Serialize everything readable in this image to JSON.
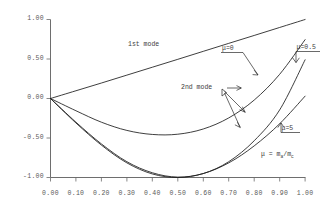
{
  "chart_data": {
    "type": "line",
    "title": "",
    "xlabel": "",
    "ylabel": "",
    "xlim": [
      0.0,
      1.0
    ],
    "ylim": [
      -1.0,
      1.0
    ],
    "grid": false,
    "legend_position": "inline-annotations",
    "xticks": [
      "0.00",
      "0.10",
      "0.20",
      "0.30",
      "0.40",
      "0.50",
      "0.60",
      "0.70",
      "0.80",
      "0.90",
      "1.00"
    ],
    "xtick_values": [
      0.0,
      0.1,
      0.2,
      0.3,
      0.4,
      0.5,
      0.6,
      0.7,
      0.8,
      0.9,
      1.0
    ],
    "yticks": [
      "1.00",
      "0.50",
      "0.00",
      "-0.50",
      "-1.00"
    ],
    "ytick_values": [
      1.0,
      0.5,
      0.0,
      -0.5,
      -1.0
    ],
    "series": [
      {
        "name": "1st mode",
        "x": [
          0.0,
          0.1,
          0.2,
          0.3,
          0.4,
          0.5,
          0.6,
          0.7,
          0.8,
          0.9,
          1.0
        ],
        "values": [
          0.0,
          0.098,
          0.196,
          0.296,
          0.396,
          0.496,
          0.597,
          0.698,
          0.798,
          0.899,
          1.0
        ]
      },
      {
        "name": "2nd mode mu=0",
        "x": [
          0.0,
          0.1,
          0.2,
          0.3,
          0.4,
          0.5,
          0.6,
          0.7,
          0.8,
          0.9,
          1.0
        ],
        "values": [
          0.0,
          -0.155,
          -0.3,
          -0.404,
          -0.455,
          -0.452,
          -0.386,
          -0.246,
          -0.02,
          0.306,
          0.745
        ]
      },
      {
        "name": "2nd mode mu=0.5",
        "x": [
          0.0,
          0.1,
          0.2,
          0.3,
          0.4,
          0.5,
          0.6,
          0.7,
          0.8,
          0.9,
          1.0
        ],
        "values": [
          0.0,
          -0.3,
          -0.575,
          -0.8,
          -0.94,
          -0.995,
          -0.95,
          -0.8,
          -0.535,
          -0.145,
          0.49
        ]
      },
      {
        "name": "2nd mode mu=5",
        "x": [
          0.0,
          0.1,
          0.2,
          0.3,
          0.4,
          0.5,
          0.6,
          0.7,
          0.8,
          0.9,
          1.0
        ],
        "values": [
          0.0,
          -0.31,
          -0.59,
          -0.815,
          -0.955,
          -1.0,
          -0.95,
          -0.815,
          -0.6,
          -0.32,
          0.03
        ]
      }
    ],
    "annotations": [
      {
        "key": "first_mode",
        "text": "1st mode"
      },
      {
        "key": "second_mode",
        "text": "2nd mode"
      },
      {
        "key": "mu0",
        "text": "μ=0"
      },
      {
        "key": "mu05",
        "text": "μ=0.5"
      },
      {
        "key": "mu5",
        "text": "μ=5"
      }
    ]
  },
  "labels": {
    "first_mode": "1st mode",
    "second_mode": "2nd mode",
    "mu_zero": "μ=0",
    "mu_half": "μ=0.5",
    "mu_five": "μ=5",
    "mu_definition_lead": "μ = m",
    "mu_definition_sub1": "a",
    "mu_definition_mid": "/m",
    "mu_definition_sub2": "c"
  },
  "axes": {
    "x_tick_0": "0.00",
    "x_tick_1": "0.10",
    "x_tick_2": "0.20",
    "x_tick_3": "0.30",
    "x_tick_4": "0.40",
    "x_tick_5": "0.50",
    "x_tick_6": "0.60",
    "x_tick_7": "0.70",
    "x_tick_8": "0.80",
    "x_tick_9": "0.90",
    "x_tick_10": "1.00",
    "y_tick_0": "1.00",
    "y_tick_1": "0.50",
    "y_tick_2": "0.00",
    "y_tick_3": "-0.50",
    "y_tick_4": "-1.00"
  },
  "colors": {
    "curve": "#1c1c1c",
    "axis": "#5e5e5e",
    "tick_text": "#5a5a5a",
    "annotation_text": "#3c3c3c",
    "background": "#ffffff"
  }
}
